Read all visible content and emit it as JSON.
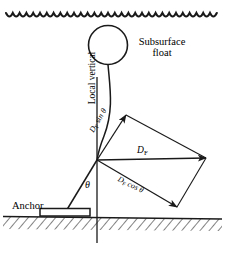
{
  "figure": {
    "background_color": "#ffffff",
    "line_color": "#1a1a1a",
    "width": 225,
    "height": 257
  },
  "labels": {
    "subsurface_float": "Subsurface float",
    "local_vertical": "Local vertical",
    "anchor": "Anchor",
    "theta": "θ",
    "force_resultant": "D",
    "force_resultant_sub": "F",
    "force_vertical": "D",
    "force_vertical_sub": "F",
    "force_vertical_trig": "sin θ",
    "force_horizontal": "D",
    "force_horizontal_sub": "F",
    "force_horizontal_trig": "cos θ"
  },
  "elements": {
    "water_surface": "wavy-line",
    "seabed": "hatched-ground-line",
    "float": "circle",
    "mooring_line": "curved-tether",
    "anchor_block": "rectangle-block",
    "vertical_axis": "vertical-reference-line",
    "vectors": [
      {
        "name": "D_F",
        "label": "D_F",
        "origin": [
          97,
          160
        ],
        "tip": [
          206,
          158
        ]
      },
      {
        "name": "D_F sin theta",
        "label": "D_F sin θ",
        "origin": [
          97,
          160
        ],
        "tip": [
          126,
          115
        ]
      },
      {
        "name": "D_F cos theta",
        "label": "D_F cos θ",
        "origin": [
          97,
          160
        ],
        "tip": [
          177,
          207
        ]
      }
    ],
    "angle_marked": "θ"
  }
}
